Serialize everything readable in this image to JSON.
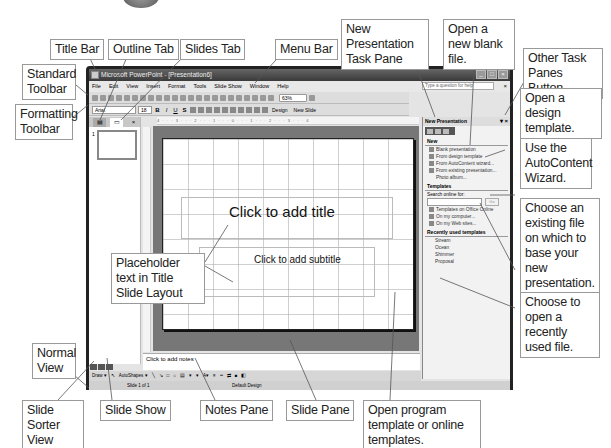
{
  "window": {
    "title": "Microsoft PowerPoint - [Presentation6]",
    "window_buttons": [
      "minimize",
      "maximize",
      "close"
    ]
  },
  "menubar": {
    "items": [
      "File",
      "Edit",
      "View",
      "Insert",
      "Format",
      "Tools",
      "Slide Show",
      "Window",
      "Help"
    ],
    "help_placeholder": "Type a question for help"
  },
  "standard_toolbar": {
    "zoom": "63%"
  },
  "formatting_toolbar": {
    "font": "Arial",
    "size": "18",
    "bold": "B",
    "italic": "I",
    "underline": "U",
    "shadow": "S",
    "design_label": "Design",
    "new_slide_label": "New Slide"
  },
  "left_pane": {
    "tabs": [
      "Outline",
      "Slides"
    ],
    "close": "×",
    "thumbnail_number": "1"
  },
  "slide": {
    "title_placeholder": "Click to add title",
    "subtitle_placeholder": "Click to add subtitle"
  },
  "ruler": {
    "horizontal": "4 · · · 3 · · · 2 · · · 1 · · · 0 · · · 1 · · · 2 · · · 3 · · · 4"
  },
  "notes": {
    "placeholder": "Click to add notes"
  },
  "drawing_toolbar": {
    "draw_label": "Draw ▾",
    "autoshapes_label": "AutoShapes ▾"
  },
  "statusbar": {
    "slide_info": "Slide 1 of 1",
    "design": "Default Design"
  },
  "task_pane": {
    "title": "New Presentation",
    "sections": {
      "new": {
        "heading": "New",
        "items": [
          "Blank presentation",
          "From design template",
          "From AutoContent wizard...",
          "From existing presentation...",
          "Photo album..."
        ]
      },
      "templates": {
        "heading": "Templates",
        "search_label": "Search online for:",
        "go_label": "Go",
        "items": [
          "Templates on Office Online",
          "On my computer...",
          "On my Web sites..."
        ]
      },
      "recent": {
        "heading": "Recently used templates",
        "items": [
          "Stream",
          "Ocean",
          "Shimmer",
          "Proposal"
        ]
      }
    }
  },
  "callouts": {
    "title_bar": "Title Bar",
    "outline_tab": "Outline Tab",
    "slides_tab": "Slides Tab",
    "menu_bar": "Menu Bar",
    "new_presentation_pane": "New Presentation Task Pane",
    "open_blank": "Open a new blank file.",
    "other_task_panes": "Other Task Panes Button",
    "standard_toolbar": "Standard Toolbar",
    "formatting_toolbar": "Formatting Toolbar",
    "open_design": "Open a design template.",
    "autocontent": "Use the AutoContent Wizard.",
    "existing_file": "Choose an existing file on which to base your new presentation.",
    "placeholder_text": "Placeholder text in Title Slide Layout",
    "recent_file": "Choose to open a recently used file.",
    "normal_view": "Normal View",
    "slide_sorter": "Slide Sorter View",
    "slide_show": "Slide Show",
    "notes_pane": "Notes Pane",
    "slide_pane": "Slide Pane",
    "program_templates": "Open program template or online templates."
  }
}
